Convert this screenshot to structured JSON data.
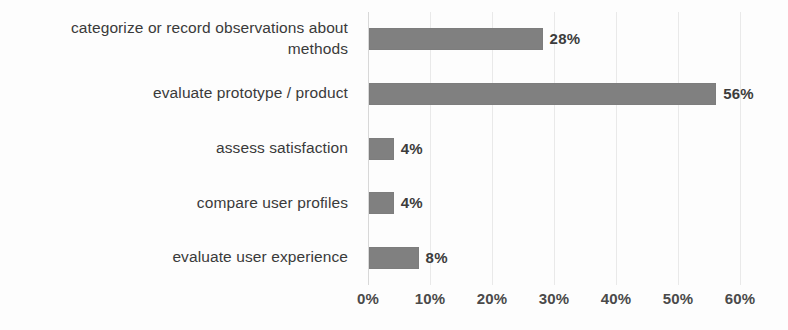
{
  "chart_data": {
    "type": "bar",
    "orientation": "horizontal",
    "title": "",
    "subtitle": "",
    "xlabel": "",
    "ylabel": "",
    "categories": [
      "categorize or record observations about methods",
      "evaluate prototype / product",
      "assess satisfaction",
      "compare user profiles",
      "evaluate user experience"
    ],
    "values": [
      28,
      56,
      4,
      4,
      8
    ],
    "value_labels": [
      "28%",
      "56%",
      "4%",
      "4%",
      "8%"
    ],
    "xlim": [
      0,
      60
    ],
    "xticks": [
      0,
      10,
      20,
      30,
      40,
      50,
      60
    ],
    "xtick_labels": [
      "0%",
      "10%",
      "20%",
      "30%",
      "40%",
      "50%",
      "60%"
    ],
    "grid": true,
    "grid_axis": "x",
    "legend": false,
    "legend_position": "none",
    "bar_color": "#808080",
    "gridline_color": "#e9e9e9",
    "text_color": "#3a3a3a",
    "background_color": "#fdfdfd"
  }
}
